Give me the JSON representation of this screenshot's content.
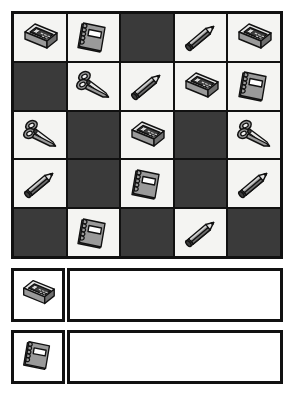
{
  "worksheet": {
    "title": "School Supplies Pattern Grid",
    "icon_colors": {
      "dark_cell": "#3a3a3a",
      "light_cell": "#f4f4f2",
      "border": "#111111",
      "object_gray": "#9a9a9a",
      "object_dark": "#3d3d3d",
      "object_light": "#e6e6e6"
    }
  },
  "grid": {
    "rows": 5,
    "columns": 5,
    "cells": [
      [
        {
          "state": "light",
          "item": "pencil-sharpener"
        },
        {
          "state": "light",
          "item": "notebook"
        },
        {
          "state": "dark",
          "item": "none"
        },
        {
          "state": "light",
          "item": "pencil"
        },
        {
          "state": "light",
          "item": "pencil-sharpener"
        }
      ],
      [
        {
          "state": "dark",
          "item": "none"
        },
        {
          "state": "light",
          "item": "scissors"
        },
        {
          "state": "light",
          "item": "pencil"
        },
        {
          "state": "light",
          "item": "pencil-sharpener"
        },
        {
          "state": "light",
          "item": "notebook"
        }
      ],
      [
        {
          "state": "light",
          "item": "scissors"
        },
        {
          "state": "dark",
          "item": "none"
        },
        {
          "state": "light",
          "item": "pencil-sharpener"
        },
        {
          "state": "dark",
          "item": "none"
        },
        {
          "state": "light",
          "item": "scissors"
        }
      ],
      [
        {
          "state": "light",
          "item": "pencil"
        },
        {
          "state": "dark",
          "item": "none"
        },
        {
          "state": "light",
          "item": "notebook"
        },
        {
          "state": "dark",
          "item": "none"
        },
        {
          "state": "light",
          "item": "pencil"
        }
      ],
      [
        {
          "state": "dark",
          "item": "none"
        },
        {
          "state": "light",
          "item": "notebook"
        },
        {
          "state": "dark",
          "item": "none"
        },
        {
          "state": "light",
          "item": "pencil"
        },
        {
          "state": "dark",
          "item": "none"
        }
      ]
    ]
  },
  "answer_rows": [
    {
      "item": "pencil-sharpener",
      "answer_value": ""
    },
    {
      "item": "notebook",
      "answer_value": ""
    }
  ]
}
